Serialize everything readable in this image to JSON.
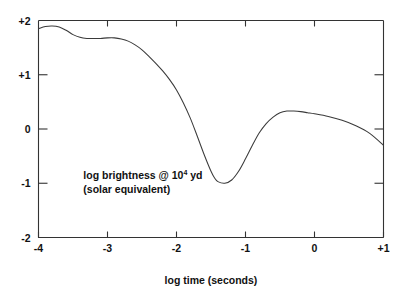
{
  "chart_data": {
    "type": "line",
    "title": "",
    "xlabel": "log time (seconds)",
    "ylabel": "",
    "xlim": [
      -4,
      1
    ],
    "ylim": [
      -2,
      2
    ],
    "grid": false,
    "legend": null,
    "xticks": [
      -4,
      -3,
      -2,
      -1,
      0,
      1
    ],
    "xticklabels": [
      "-4",
      "-3",
      "-2",
      "-1",
      "0",
      "+1"
    ],
    "yticks": [
      -2,
      -1,
      0,
      1,
      2
    ],
    "yticklabels": [
      "-2",
      "-1",
      "0",
      "+1",
      "+2"
    ],
    "series": [
      {
        "name": "log brightness @ 10^4 yd (solar equivalent)",
        "x": [
          -4.0,
          -3.9,
          -3.8,
          -3.7,
          -3.6,
          -3.5,
          -3.4,
          -3.3,
          -3.2,
          -3.1,
          -3.0,
          -2.9,
          -2.8,
          -2.7,
          -2.6,
          -2.5,
          -2.4,
          -2.3,
          -2.2,
          -2.1,
          -2.0,
          -1.9,
          -1.8,
          -1.7,
          -1.6,
          -1.5,
          -1.45,
          -1.4,
          -1.3,
          -1.2,
          -1.1,
          -1.0,
          -0.9,
          -0.8,
          -0.7,
          -0.6,
          -0.5,
          -0.4,
          -0.3,
          -0.2,
          -0.1,
          0.0,
          0.2,
          0.4,
          0.6,
          0.8,
          1.0
        ],
        "y": [
          1.85,
          1.89,
          1.9,
          1.88,
          1.82,
          1.74,
          1.69,
          1.67,
          1.67,
          1.67,
          1.68,
          1.68,
          1.66,
          1.62,
          1.55,
          1.46,
          1.34,
          1.21,
          1.07,
          0.91,
          0.72,
          0.48,
          0.2,
          -0.13,
          -0.47,
          -0.78,
          -0.9,
          -0.97,
          -1.0,
          -0.94,
          -0.78,
          -0.55,
          -0.3,
          -0.07,
          0.1,
          0.22,
          0.3,
          0.33,
          0.33,
          0.32,
          0.3,
          0.28,
          0.23,
          0.16,
          0.06,
          -0.08,
          -0.3
        ]
      }
    ],
    "annotations": [
      {
        "name": "curve-label",
        "line1_pre": "log brightness @ 10",
        "line1_sup": "4",
        "line1_post": " yd",
        "line2": "(solar equivalent)",
        "x": -3.35,
        "y": -0.92
      }
    ],
    "colors": {
      "curve": "#3a3a3a",
      "axis": "#333333",
      "text": "#111111",
      "background": "#ffffff"
    }
  },
  "axes": {
    "x_title": "log time (seconds)"
  }
}
